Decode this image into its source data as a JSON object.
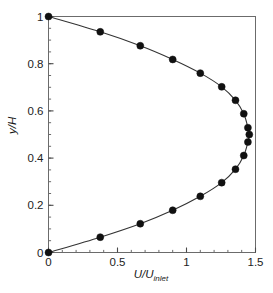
{
  "chart_data": {
    "type": "line",
    "title": "",
    "subtitle": "",
    "xlabel_text": "U/U",
    "xlabel_sub": "inlet",
    "ylabel_text": "y/H",
    "ylabel_sub": "",
    "xlim": [
      0,
      1.5
    ],
    "ylim": [
      0,
      1
    ],
    "xticks": [
      0,
      0.5,
      1,
      1.5
    ],
    "xtick_labels": [
      "0",
      "0.5",
      "1",
      "1.5"
    ],
    "yticks": [
      0,
      0.2,
      0.4,
      0.6,
      0.8,
      1
    ],
    "ytick_labels": [
      "0",
      "0.2",
      "0.4",
      "0.6",
      "0.8",
      "1"
    ],
    "x_minor_step": 0.1,
    "y_minor_step": 0.05,
    "grid": false,
    "legend": false,
    "legend_position": "none",
    "frame": "box",
    "tick_direction": "in",
    "line_color": "#333333",
    "marker_color": "#111111",
    "marker_shape": "circle",
    "marker_size_px": 7,
    "series": [
      {
        "name": "velocity profile",
        "x": [
          0.0,
          0.375,
          0.665,
          0.9,
          1.1,
          1.255,
          1.355,
          1.415,
          1.445,
          1.455,
          1.445,
          1.415,
          1.355,
          1.255,
          1.1,
          0.9,
          0.665,
          0.375,
          0.0
        ],
        "y": [
          0.0,
          0.065,
          0.122,
          0.179,
          0.238,
          0.296,
          0.353,
          0.411,
          0.468,
          0.5,
          0.529,
          0.588,
          0.645,
          0.702,
          0.76,
          0.818,
          0.876,
          0.935,
          1.0
        ]
      }
    ]
  }
}
